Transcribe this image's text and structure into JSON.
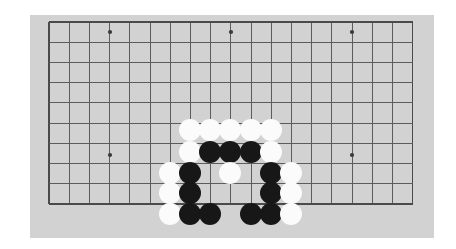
{
  "app": {
    "title": "Go Board",
    "page_background": "#ffffff"
  },
  "board": {
    "name": "go-board",
    "background_color": "#d2d2d2",
    "line_color": "#5c5c5c",
    "edge_line_color": "#4a4a4a",
    "star_point_color": "#3a3a3a",
    "panel": {
      "x": 30,
      "y": 15,
      "width": 404,
      "height": 223
    },
    "grid": {
      "origin_x": 49,
      "origin_y": 22,
      "cell": 20.2,
      "cols": 19,
      "rows": 10,
      "visible_columns": 19,
      "visible_rows": 10
    },
    "star_points": [
      {
        "x": 110,
        "y": 32
      },
      {
        "x": 231,
        "y": 32
      },
      {
        "x": 352,
        "y": 32
      },
      {
        "x": 110,
        "y": 155
      },
      {
        "x": 352,
        "y": 155
      }
    ],
    "stone_radius": 11,
    "stone_colors": {
      "black": "#171717",
      "white": "#fbfbfb"
    }
  },
  "stones": [
    {
      "color": "white",
      "x": 190,
      "y": 130
    },
    {
      "color": "white",
      "x": 210,
      "y": 130
    },
    {
      "color": "white",
      "x": 230,
      "y": 130
    },
    {
      "color": "white",
      "x": 251,
      "y": 130
    },
    {
      "color": "white",
      "x": 271,
      "y": 130
    },
    {
      "color": "white",
      "x": 190,
      "y": 152
    },
    {
      "color": "black",
      "x": 210,
      "y": 152
    },
    {
      "color": "black",
      "x": 230,
      "y": 152
    },
    {
      "color": "black",
      "x": 251,
      "y": 152
    },
    {
      "color": "white",
      "x": 271,
      "y": 152
    },
    {
      "color": "white",
      "x": 170,
      "y": 173
    },
    {
      "color": "black",
      "x": 190,
      "y": 173
    },
    {
      "color": "white",
      "x": 230,
      "y": 173
    },
    {
      "color": "black",
      "x": 271,
      "y": 173
    },
    {
      "color": "white",
      "x": 291,
      "y": 173
    },
    {
      "color": "white",
      "x": 170,
      "y": 193
    },
    {
      "color": "black",
      "x": 190,
      "y": 193
    },
    {
      "color": "black",
      "x": 271,
      "y": 193
    },
    {
      "color": "white",
      "x": 291,
      "y": 193
    },
    {
      "color": "white",
      "x": 170,
      "y": 214
    },
    {
      "color": "black",
      "x": 190,
      "y": 214
    },
    {
      "color": "black",
      "x": 210,
      "y": 214
    },
    {
      "color": "black",
      "x": 251,
      "y": 214
    },
    {
      "color": "black",
      "x": 271,
      "y": 214
    },
    {
      "color": "white",
      "x": 291,
      "y": 214
    }
  ],
  "summary": {
    "black_stone_count": 13,
    "white_stone_count": 12,
    "total_stones": 25
  }
}
